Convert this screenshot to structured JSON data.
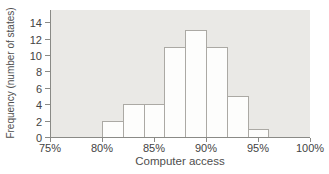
{
  "chart_data": {
    "type": "bar",
    "subtype": "histogram",
    "title": "",
    "xlabel": "Computer access",
    "ylabel": "Frequency (number of states)",
    "xlim": [
      75,
      100
    ],
    "ylim": [
      0,
      14
    ],
    "x_tick_values": [
      75,
      80,
      85,
      90,
      95,
      100
    ],
    "x_tick_labels": [
      "75%",
      "80%",
      "85%",
      "90%",
      "95%",
      "100%"
    ],
    "y_tick_values": [
      0,
      2,
      4,
      6,
      8,
      10,
      12,
      14
    ],
    "y_tick_labels": [
      "0",
      "2",
      "4",
      "6",
      "8",
      "10",
      "12",
      "14"
    ],
    "bin_width_percent": 2,
    "bin_edges": [
      80,
      82,
      84,
      86,
      88,
      90,
      92,
      94,
      96
    ],
    "bin_labels": [
      "80-82%",
      "82-84%",
      "84-86%",
      "86-88%",
      "88-90%",
      "90-92%",
      "92-94%",
      "94-96%"
    ],
    "values": [
      2,
      4,
      4,
      11,
      13,
      11,
      5,
      1
    ],
    "grid": false,
    "legend": false,
    "colors": {
      "page_background": "#ffffff",
      "plot_background": "#eae9e6",
      "bar_fill": "#fdfdfc",
      "bar_border": "#aba9a4",
      "axis": "#8a8a86",
      "text": "#434343"
    }
  }
}
